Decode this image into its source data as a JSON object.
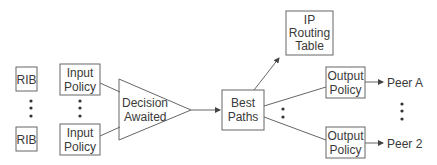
{
  "diagram": {
    "rib_top": "RIB",
    "rib_bottom": "RIB",
    "input_policy_top": [
      "Input",
      "Policy"
    ],
    "input_policy_bottom": [
      "Input",
      "Policy"
    ],
    "decision": [
      "Decision",
      "Awaited"
    ],
    "best_paths": [
      "Best",
      "Paths"
    ],
    "ip_routing_table": [
      "IP",
      "Routing",
      "Table"
    ],
    "output_policy_top": [
      "Output",
      "Policy"
    ],
    "output_policy_bottom": [
      "Output",
      "Policy"
    ],
    "peer_a": "Peer A",
    "peer_2": "Peer 2"
  },
  "colors": {
    "stroke": "#555555",
    "text": "#3a3a3a",
    "background": "#ffffff"
  }
}
